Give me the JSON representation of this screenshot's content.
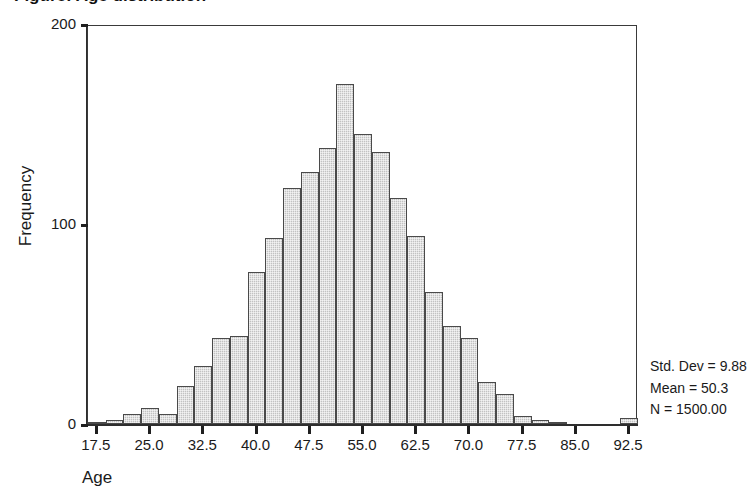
{
  "figure": {
    "title_clipped": "Figure: Age distribution",
    "background": "#ffffff",
    "bar_fill": "#c2c2c2",
    "bar_border": "#4a4a4a",
    "axis_color": "#2e2e2e"
  },
  "axes": {
    "y_title": "Frequency",
    "x_title": "Age",
    "y_ticks": [
      "0",
      "100",
      "200"
    ],
    "x_ticks": [
      "17.5",
      "25.0",
      "32.5",
      "40.0",
      "47.5",
      "55.0",
      "62.5",
      "70.0",
      "77.5",
      "85.0",
      "92.5"
    ]
  },
  "stats": {
    "std_dev": "Std. Dev = 9.88",
    "mean": "Mean = 50.3",
    "n": "N = 1500.00"
  },
  "chart_data": {
    "type": "bar",
    "title": "",
    "xlabel": "Age",
    "ylabel": "Frequency",
    "xlim": [
      16.25,
      93.75
    ],
    "ylim": [
      0,
      200
    ],
    "grid": false,
    "legend": null,
    "bin_width": 2.5,
    "categories": [
      "16.25-18.75",
      "18.75-21.25",
      "21.25-23.75",
      "23.75-26.25",
      "26.25-28.75",
      "28.75-31.25",
      "31.25-33.75",
      "33.75-36.25",
      "36.25-38.75",
      "38.75-41.25",
      "41.25-43.75",
      "43.75-46.25",
      "46.25-48.75",
      "48.75-51.25",
      "51.25-53.75",
      "53.75-56.25",
      "56.25-58.75",
      "58.75-61.25",
      "61.25-63.75",
      "63.75-66.25",
      "66.25-68.75",
      "68.75-71.25",
      "71.25-73.75",
      "73.75-76.25",
      "76.25-78.75",
      "78.75-81.25",
      "81.25-83.75",
      "83.75-86.25",
      "86.25-88.75",
      "88.75-91.25",
      "91.25-93.75"
    ],
    "bin_centers": [
      17.5,
      20.0,
      22.5,
      25.0,
      27.5,
      30.0,
      32.5,
      35.0,
      37.5,
      40.0,
      42.5,
      45.0,
      47.5,
      50.0,
      52.5,
      55.0,
      57.5,
      60.0,
      62.5,
      65.0,
      67.5,
      70.0,
      72.5,
      75.0,
      77.5,
      80.0,
      82.5,
      85.0,
      87.5,
      90.0,
      92.5
    ],
    "values": [
      1,
      2,
      5,
      8,
      5,
      19,
      29,
      43,
      44,
      76,
      93,
      118,
      126,
      138,
      170,
      145,
      136,
      113,
      94,
      66,
      49,
      43,
      21,
      15,
      4,
      2,
      1,
      0,
      0,
      0,
      3
    ],
    "annotations": [
      "Std. Dev = 9.88",
      "Mean = 50.3",
      "N = 1500.00"
    ]
  }
}
